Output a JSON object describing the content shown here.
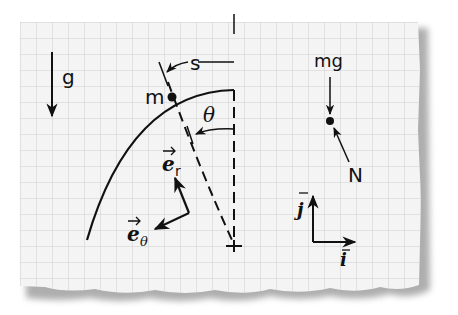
{
  "diagram": {
    "type": "physics free-body diagram on graph paper",
    "labels": {
      "gravity": "g",
      "mass": "m",
      "arc_length": "s",
      "angle": "θ",
      "unit_r": "e",
      "unit_r_sub": "r",
      "unit_theta": "e",
      "unit_theta_sub": "θ",
      "weight": "mg",
      "normal": "N",
      "unit_j": "j",
      "unit_i": "i"
    },
    "colors": {
      "paper": "#f4f4f4",
      "grid": "#cfcfcf",
      "ink": "#111111",
      "shadow": "#9a9a9a"
    }
  }
}
